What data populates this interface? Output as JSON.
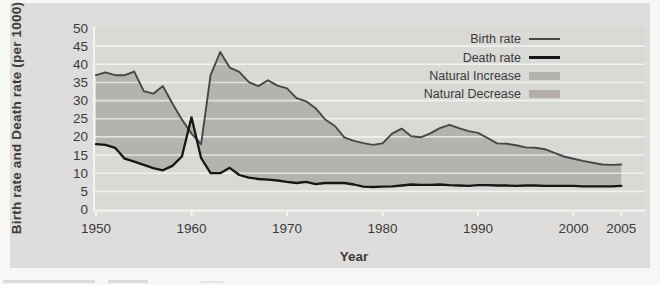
{
  "colors": {
    "page_bg": "#f7f7f5",
    "panel_bg": "#dedddb",
    "plot_bg": "#d9d9d6",
    "grid": "#f4f4f1",
    "axis": "#f4f4f1",
    "text": "#3b3b3b",
    "birth_line": "#4a4547",
    "death_line": "#161616",
    "natural_increase": "#b2b5af",
    "natural_decrease": "#b6abab"
  },
  "chart_data": {
    "type": "line",
    "title": "",
    "xlabel": "Year",
    "ylabel": "Birth rate and Death rate (per 1000)",
    "xlim": [
      1950,
      2007.5
    ],
    "ylim": [
      0,
      50
    ],
    "x_ticks": [
      1950,
      1960,
      1970,
      1980,
      1990,
      2000,
      2005
    ],
    "y_ticks": [
      0,
      5,
      10,
      15,
      20,
      25,
      30,
      35,
      40,
      45,
      50
    ],
    "grid": "horizontal white gridlines every 5 units",
    "legend_position": "top-right inside plot",
    "years": [
      1950,
      1951,
      1952,
      1953,
      1954,
      1955,
      1956,
      1957,
      1958,
      1959,
      1960,
      1961,
      1962,
      1963,
      1964,
      1965,
      1966,
      1967,
      1968,
      1969,
      1970,
      1971,
      1972,
      1973,
      1974,
      1975,
      1976,
      1977,
      1978,
      1979,
      1980,
      1981,
      1982,
      1983,
      1984,
      1985,
      1986,
      1987,
      1988,
      1989,
      1990,
      1991,
      1992,
      1993,
      1994,
      1995,
      1996,
      1997,
      1998,
      1999,
      2000,
      2001,
      2002,
      2003,
      2004,
      2005
    ],
    "series": [
      {
        "name": "Birth rate",
        "color": "#4a4547",
        "values": [
          37.0,
          37.8,
          37.0,
          37.0,
          38.0,
          32.6,
          31.9,
          34.0,
          29.2,
          24.8,
          20.9,
          18.0,
          37.0,
          43.4,
          39.1,
          37.9,
          35.1,
          34.0,
          35.6,
          34.1,
          33.4,
          30.7,
          29.8,
          27.9,
          24.8,
          23.0,
          19.9,
          18.9,
          18.3,
          17.8,
          18.2,
          20.9,
          22.3,
          20.2,
          19.9,
          21.0,
          22.4,
          23.3,
          22.4,
          21.6,
          21.1,
          19.7,
          18.2,
          18.1,
          17.7,
          17.1,
          17.0,
          16.6,
          15.6,
          14.6,
          14.0,
          13.4,
          12.9,
          12.4,
          12.3,
          12.4
        ]
      },
      {
        "name": "Death rate",
        "color": "#161616",
        "values": [
          18.0,
          17.8,
          17.0,
          14.0,
          13.2,
          12.3,
          11.4,
          10.8,
          12.0,
          14.6,
          25.4,
          14.2,
          10.0,
          10.0,
          11.5,
          9.5,
          8.8,
          8.4,
          8.2,
          8.0,
          7.6,
          7.3,
          7.6,
          7.0,
          7.3,
          7.3,
          7.3,
          6.9,
          6.3,
          6.2,
          6.3,
          6.4,
          6.6,
          6.9,
          6.8,
          6.8,
          6.9,
          6.7,
          6.6,
          6.5,
          6.7,
          6.7,
          6.6,
          6.6,
          6.5,
          6.6,
          6.6,
          6.5,
          6.5,
          6.5,
          6.5,
          6.4,
          6.4,
          6.4,
          6.4,
          6.5
        ]
      }
    ],
    "areas": [
      {
        "name": "Natural Increase",
        "color": "#b2b5af",
        "region": "between curves where birth rate > death rate"
      },
      {
        "name": "Natural Decrease",
        "color": "#b6abab",
        "region": "between curves where death rate > birth rate (around 1960)"
      }
    ],
    "legend": {
      "items": [
        {
          "label": "Birth rate",
          "swatch": "line",
          "color": "#4a4547"
        },
        {
          "label": "Death rate",
          "swatch": "line",
          "color": "#161616"
        },
        {
          "label": "Natural Increase",
          "swatch": "fill",
          "color": "#b2b5af"
        },
        {
          "label": "Natural Decrease",
          "swatch": "fill",
          "color": "#b6abab"
        }
      ]
    }
  }
}
